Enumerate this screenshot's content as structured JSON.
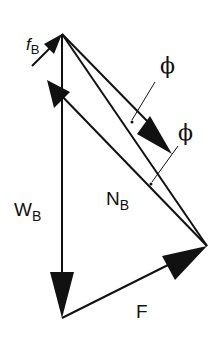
{
  "diagram": {
    "labels": {
      "fB": "f",
      "fB_sub": "B",
      "WB": "W",
      "WB_sub": "B",
      "NB": "N",
      "NB_sub": "B",
      "F": "F",
      "phi1": "ϕ",
      "phi2": "ϕ"
    },
    "vectors": [
      {
        "name": "W_B",
        "from": [
          62,
          34
        ],
        "to": [
          62,
          318
        ]
      },
      {
        "name": "F",
        "from": [
          62,
          318
        ],
        "to": [
          207,
          246
        ]
      },
      {
        "name": "N_B",
        "from": [
          207,
          246
        ],
        "to": [
          32,
          66
        ]
      },
      {
        "name": "f_B",
        "from": [
          32,
          66
        ],
        "to": [
          62,
          34
        ]
      },
      {
        "name": "resultant",
        "from": [
          62,
          34
        ],
        "to": [
          207,
          246
        ]
      }
    ],
    "stroke_color": "#111111",
    "background": "#ffffff"
  }
}
